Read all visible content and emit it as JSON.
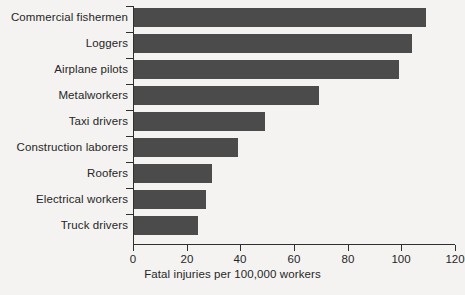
{
  "chart_data": {
    "type": "bar",
    "orientation": "horizontal",
    "title": "",
    "xlabel": "Fatal injuries per 100,000 workers",
    "ylabel": "",
    "categories": [
      "Commercial fishermen",
      "Loggers",
      "Airplane pilots",
      "Metalworkers",
      "Taxi drivers",
      "Construction laborers",
      "Roofers",
      "Electrical workers",
      "Truck drivers"
    ],
    "values": [
      109,
      104,
      99,
      69,
      49,
      39,
      29,
      27,
      24
    ],
    "xlim": [
      0,
      120
    ],
    "xticks": [
      0,
      20,
      40,
      60,
      80,
      100,
      120
    ],
    "xtick_labels": [
      "0",
      "20",
      "40",
      "60",
      "80",
      "100",
      "120"
    ],
    "grid": false,
    "legend": false,
    "bar_color": "#4b4b4b",
    "background_color": "#f4f3f1",
    "axis_color": "#2f2f2f",
    "text_color": "#262626"
  }
}
